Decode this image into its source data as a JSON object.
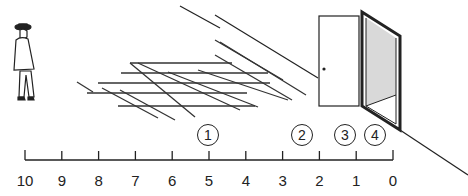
{
  "diagram": {
    "scale": {
      "ticks": [
        "10",
        "9",
        "8",
        "7",
        "6",
        "5",
        "4",
        "3",
        "2",
        "1",
        "0"
      ]
    },
    "markers": [
      {
        "label": "1",
        "position": 5
      },
      {
        "label": "2",
        "position": 2.5
      },
      {
        "label": "3",
        "position": 1.2
      },
      {
        "label": "4",
        "position": 0.4
      }
    ],
    "elements": {
      "person": "walking-man-with-hat",
      "grid": "perspective-floor-grid",
      "door": "open-door-with-frame",
      "shade_color": "#d9d9d9",
      "line_color": "#222222"
    }
  }
}
